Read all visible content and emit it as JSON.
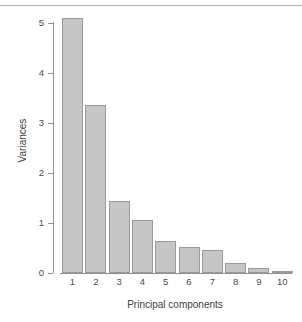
{
  "figure": {
    "kind": "scree-plot",
    "background_color": "#ffffff",
    "rule_color": "#b0b2b5",
    "axis_color": "#8d8f91",
    "bar_fill_color": "#c6c6c6",
    "bar_border_color": "#9a9a9a",
    "text_color": "#3d3d3d"
  },
  "chart_data": {
    "type": "bar",
    "title": "",
    "subtitle": "",
    "xlabel": "Principal components",
    "ylabel": "Variances",
    "categories": [
      "1",
      "2",
      "3",
      "4",
      "5",
      "6",
      "7",
      "8",
      "9",
      "10"
    ],
    "values": [
      5.09,
      3.36,
      1.44,
      1.06,
      0.64,
      0.52,
      0.46,
      0.2,
      0.1,
      0.04
    ],
    "xlim": [
      0.4,
      10.6
    ],
    "ylim": [
      0,
      5.2
    ],
    "yticks": [
      0,
      1,
      2,
      3,
      4,
      5
    ],
    "ytick_labels": [
      "0",
      "1",
      "2",
      "3",
      "4",
      "5"
    ],
    "xtick_labels": [
      "1",
      "2",
      "3",
      "4",
      "5",
      "6",
      "7",
      "8",
      "9",
      "10"
    ],
    "grid": false,
    "legend": null,
    "annotations": []
  }
}
